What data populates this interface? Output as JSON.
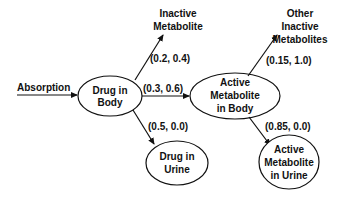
{
  "diagram": {
    "type": "flow",
    "colors": {
      "stroke": "#111111",
      "background": "#ffffff"
    },
    "input": {
      "label": "Absorption"
    },
    "nodes": {
      "drug_body": {
        "line1": "Drug in",
        "line2": "Body"
      },
      "inactive_met": {
        "line1": "Inactive",
        "line2": "Metabolite"
      },
      "active_met_body": {
        "line1": "Active",
        "line2": "Metabolite",
        "line3": "in Body"
      },
      "drug_urine": {
        "line1": "Drug in",
        "line2": "Urine"
      },
      "other_inactive": {
        "line1": "Other",
        "line2": "Inactive",
        "line3": "Metabolites"
      },
      "active_met_urine": {
        "line1": "Active",
        "line2": "Metabolite",
        "line3": "in Urine"
      }
    },
    "edges": {
      "absorption_to_drug_body": {
        "label": ""
      },
      "drug_body_to_inactive": {
        "label": "(0.2, 0.4)"
      },
      "drug_body_to_active": {
        "label": "(0.3, 0.6)"
      },
      "drug_body_to_urine": {
        "label": "(0.5, 0.0)"
      },
      "active_to_other_inactive": {
        "label": "(0.15, 1.0)"
      },
      "active_to_urine": {
        "label": "(0.85, 0.0)"
      }
    }
  }
}
